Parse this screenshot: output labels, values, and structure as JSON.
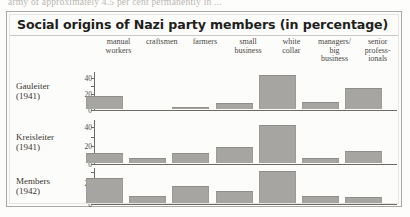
{
  "page_text_fragment": "army of approximately 4.5 per cent permanently in ...",
  "figure": {
    "title": "Social origins of Nazi party members (in percentage)"
  },
  "chart_data": {
    "type": "bar",
    "title": "Social origins of Nazi party members (in percentage)",
    "xlabel": "",
    "ylabel": "",
    "unit": "percentage",
    "grid": false,
    "legend_position": "none",
    "orientation": "grouped-rows",
    "categories": [
      "manual workers",
      "craftsmen",
      "farmers",
      "small business",
      "white collar",
      "managers/ big business",
      "senior professionals"
    ],
    "category_lines": [
      [
        "manual",
        "workers"
      ],
      [
        "craftsmen"
      ],
      [
        "farmers"
      ],
      [
        "small",
        "business"
      ],
      [
        "white",
        "collar"
      ],
      [
        "managers/",
        "big",
        "business"
      ],
      [
        "senior",
        "profess-",
        "ionals"
      ]
    ],
    "series": [
      {
        "name": "Gauleiter (1941)",
        "name_lines": [
          "Gauleiter",
          "(1941)"
        ],
        "values": [
          16,
          0,
          2,
          7,
          43,
          9,
          26
        ],
        "ylim": [
          0,
          48
        ],
        "yticks": [
          0,
          20,
          40
        ]
      },
      {
        "name": "Kreisleiter (1941)",
        "name_lines": [
          "Kreisleiter",
          "(1941)"
        ],
        "values": [
          11,
          5,
          11,
          18,
          42,
          6,
          13
        ],
        "ylim": [
          0,
          48
        ],
        "yticks": [
          0,
          20,
          40
        ]
      },
      {
        "name": "Members (1942)",
        "name_lines": [
          "Members",
          "(1942)"
        ],
        "values": [
          24,
          7,
          16,
          11,
          30,
          7,
          6
        ],
        "ylim": [
          0,
          34
        ],
        "yticks": [
          0,
          20
        ]
      }
    ]
  },
  "colors": {
    "bar_fill": "#a6a5a2",
    "axis": "#6d6a66",
    "frame": "#a9a8a4",
    "text": "#39352f",
    "background": "#fcfcfb"
  }
}
